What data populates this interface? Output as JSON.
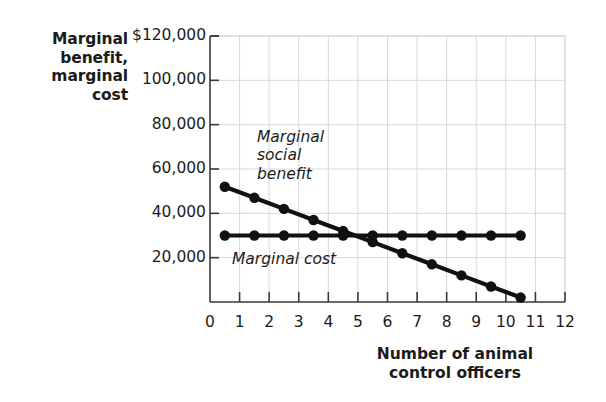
{
  "chart_data": {
    "type": "line",
    "title": "",
    "xlabel": "Number of animal control officers",
    "ylabel": "Marginal benefit, marginal cost",
    "xlim": [
      0,
      12
    ],
    "ylim": [
      0,
      120000
    ],
    "grid": true,
    "legend_position": "inline-annotations",
    "x_ticks": [
      "0",
      "1",
      "2",
      "3",
      "4",
      "5",
      "6",
      "7",
      "8",
      "9",
      "10",
      "11",
      "12"
    ],
    "x_tick_values": [
      0,
      1,
      2,
      3,
      4,
      5,
      6,
      7,
      8,
      9,
      10,
      11,
      12
    ],
    "y_ticks": [
      "$120,000",
      "100,000",
      "80,000",
      "60,000",
      "40,000",
      "20,000"
    ],
    "y_tick_values": [
      120000,
      100000,
      80000,
      60000,
      40000,
      20000
    ],
    "x": [
      0.5,
      1.5,
      2.5,
      3.5,
      4.5,
      5.5,
      6.5,
      7.5,
      8.5,
      9.5,
      10.5
    ],
    "series": [
      {
        "name": "Marginal social benefit",
        "values": [
          52000,
          47000,
          42000,
          37000,
          32000,
          27000,
          22000,
          17000,
          12000,
          7000,
          2000
        ],
        "color": "#111111"
      },
      {
        "name": "Marginal cost",
        "values": [
          30000,
          30000,
          30000,
          30000,
          30000,
          30000,
          30000,
          30000,
          30000,
          30000,
          30000
        ],
        "color": "#111111"
      }
    ],
    "annotations": [
      {
        "text": "Marginal social benefit",
        "lines": [
          "Marginal",
          "social",
          "benefit"
        ]
      },
      {
        "text": "Marginal cost",
        "lines": [
          "Marginal cost"
        ]
      }
    ],
    "equilibrium_x": 5,
    "equilibrium_y": 30000
  },
  "axes": {
    "y_title_lines": [
      "Marginal",
      "benefit,",
      "marginal",
      "cost"
    ],
    "x_title_lines": [
      "Number of animal",
      "control officers"
    ]
  },
  "colors": {
    "series": "#111111",
    "grid": "#d8d8d8",
    "axis": "#3a3a3a",
    "text": "#1b1b1b",
    "background": "#ffffff"
  }
}
